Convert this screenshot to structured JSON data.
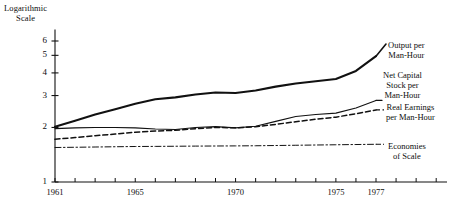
{
  "chart_data": {
    "type": "line",
    "title": "",
    "subtitle": "",
    "xlabel": "",
    "ylabel": "Logarithmic\nScale",
    "yscale": "log",
    "ylim": [
      1,
      6.6
    ],
    "xlim": [
      1961,
      1977.6
    ],
    "grid": false,
    "legend_position": "right-inline",
    "ytick_labels": [
      "6",
      "5",
      "4",
      "3",
      "2",
      "1"
    ],
    "ytick_values": [
      6,
      5,
      4,
      3,
      2,
      1
    ],
    "xtick_labels": [
      "1961",
      "1965",
      "1970",
      "1975",
      "1977"
    ],
    "xtick_values": [
      1961,
      1965,
      1970,
      1975,
      1977
    ],
    "xtick_minor_step": 1,
    "x": [
      1961,
      1962,
      1963,
      1964,
      1965,
      1966,
      1967,
      1968,
      1969,
      1970,
      1971,
      1972,
      1973,
      1974,
      1975,
      1976,
      1977
    ],
    "series": [
      {
        "name": "Output per Man-Hour",
        "label": "Output per\nMan-Hour",
        "style": "solid-thick",
        "color": "#111111",
        "width": 2.1,
        "values": [
          2.02,
          2.18,
          2.36,
          2.52,
          2.7,
          2.86,
          2.93,
          3.04,
          3.12,
          3.1,
          3.2,
          3.36,
          3.5,
          3.6,
          3.7,
          4.1,
          4.95
        ]
      },
      {
        "name": "Net Capital Stock per Man-Hour",
        "label": "Net Capital\nStock per\nMan-Hour",
        "style": "solid-thin",
        "color": "#111111",
        "width": 1.1,
        "values": [
          1.97,
          1.99,
          2.0,
          2.0,
          1.99,
          1.96,
          1.95,
          2.0,
          2.02,
          1.99,
          2.03,
          2.16,
          2.3,
          2.36,
          2.4,
          2.56,
          2.82
        ]
      },
      {
        "name": "Real Earnings per Man-Hour",
        "label": "Real Earnings\nper Man-Hour",
        "style": "dashed",
        "color": "#111111",
        "width": 1.5,
        "values": [
          1.72,
          1.76,
          1.8,
          1.84,
          1.88,
          1.91,
          1.93,
          1.97,
          2.0,
          1.99,
          2.02,
          2.08,
          2.15,
          2.22,
          2.28,
          2.38,
          2.5
        ]
      },
      {
        "name": "Economies of Scale",
        "label": "Economies\nof Scale",
        "style": "dash-dot",
        "color": "#111111",
        "width": 1.0,
        "values": [
          1.55,
          1.555,
          1.56,
          1.565,
          1.57,
          1.572,
          1.575,
          1.578,
          1.58,
          1.582,
          1.585,
          1.59,
          1.595,
          1.6,
          1.605,
          1.61,
          1.615
        ]
      }
    ]
  },
  "axis": {
    "y_title_line1": "Logarithmic",
    "y_title_line2": "Scale"
  },
  "labels": {
    "output_line1": "Output per",
    "output_line2": "Man-Hour",
    "capital_line1": "Net Capital",
    "capital_line2": "Stock per",
    "capital_line3": "Man-Hour",
    "earnings_line1": "Real Earnings",
    "earnings_line2": "per Man-Hour",
    "scale_line1": "Economies",
    "scale_line2": "of Scale"
  },
  "ticks": {
    "y": [
      "6",
      "5",
      "4",
      "3",
      "2",
      "1"
    ],
    "x": [
      "1961",
      "1965",
      "1970",
      "1975",
      "1977"
    ]
  }
}
